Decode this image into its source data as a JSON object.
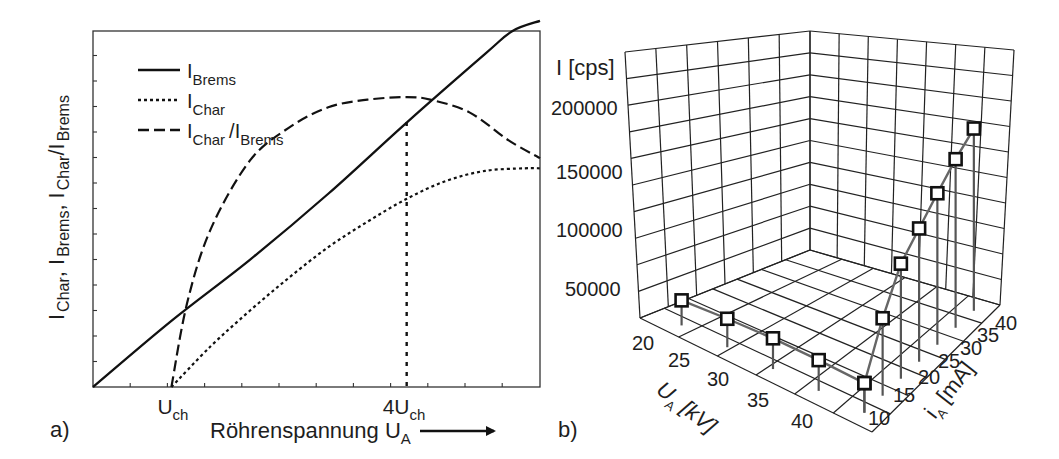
{
  "chart_data": [
    {
      "panel_label": "a)",
      "type": "line",
      "title": "",
      "xlabel": "Röhrenspannung U_A",
      "xlabel_main": "Röhrenspannung U",
      "xlabel_sub": "A",
      "ylabel_parts": [
        {
          "t": "I",
          "s": "Char"
        },
        {
          "t": ", I",
          "s": "Brems"
        },
        {
          "t": ", I",
          "s": "Char"
        },
        {
          "t": "/I",
          "s": "Brems"
        }
      ],
      "x_ticks": [
        {
          "main": "U",
          "sub": "ch",
          "x": 1
        },
        {
          "main": "4U",
          "sub": "ch",
          "x": 4
        }
      ],
      "xlim": [
        0,
        5.7
      ],
      "ylim": [
        0,
        14
      ],
      "grid": false,
      "legend_position": "upper left",
      "vline": {
        "x": 4,
        "style": "dotted"
      },
      "legend": [
        {
          "name": "I_Brems",
          "main": "I",
          "sub": "Brems",
          "style": "solid"
        },
        {
          "name": "I_Char",
          "main": "I",
          "sub": "Char",
          "style": "dotted"
        },
        {
          "name": "I_Char/I_Brems",
          "main": "I",
          "sub": "Char",
          "main2": "/I",
          "sub2": "Brems",
          "style": "dashed"
        }
      ],
      "series": [
        {
          "name": "I_Brems",
          "style": "solid",
          "x": [
            0,
            1,
            2,
            3,
            4,
            5,
            5.35,
            5.7
          ],
          "y": [
            0,
            2.6,
            5.0,
            7.6,
            10.4,
            13.1,
            14.0,
            14.4
          ]
        },
        {
          "name": "I_Char",
          "style": "dotted",
          "x": [
            1,
            1.5,
            2,
            2.5,
            3,
            3.5,
            4,
            4.5,
            5,
            5.5,
            5.7
          ],
          "y": [
            0,
            1.6,
            3.0,
            4.3,
            5.5,
            6.5,
            7.4,
            8.1,
            8.5,
            8.6,
            8.6
          ]
        },
        {
          "name": "I_Char/I_Brems",
          "style": "dashed",
          "x": [
            1,
            1.2,
            1.5,
            2,
            2.5,
            3,
            3.5,
            4,
            4.3,
            4.8,
            5.3,
            5.7
          ],
          "y": [
            0,
            3.3,
            6.2,
            8.9,
            10.2,
            11.0,
            11.3,
            11.4,
            11.3,
            10.8,
            9.7,
            9.0
          ]
        }
      ]
    },
    {
      "panel_label": "b)",
      "type": "scatter3d",
      "title": "",
      "zlabel": "I [cps]",
      "xlabel": "U_A [kV]",
      "xlabel_main": "U",
      "xlabel_sub": "A",
      "xlabel_unit": " [kV]",
      "ylabel": "i_A [mA]",
      "ylabel_main": "i",
      "ylabel_sub": "A",
      "ylabel_unit": " [mA]",
      "z_ticks": [
        "50000",
        "100000",
        "150000",
        "200000"
      ],
      "x_ticks": [
        "20",
        "25",
        "30",
        "35",
        "40"
      ],
      "y_ticks": [
        "10",
        "15",
        "20",
        "25",
        "30",
        "35",
        "40"
      ],
      "grid": true,
      "series": [
        {
          "name": "U_A scan (i_A = 10 mA)",
          "points": [
            {
              "U_A": 20,
              "i_A": 10,
              "I": 22000
            },
            {
              "U_A": 25,
              "i_A": 10,
              "I": 25000
            },
            {
              "U_A": 30,
              "i_A": 10,
              "I": 27000
            },
            {
              "U_A": 35,
              "i_A": 10,
              "I": 27000
            },
            {
              "U_A": 40,
              "i_A": 10,
              "I": 26000
            }
          ]
        },
        {
          "name": "i_A scan (U_A = 40 kV)",
          "points": [
            {
              "U_A": 40,
              "i_A": 10,
              "I": 26000
            },
            {
              "U_A": 40,
              "i_A": 15,
              "I": 68000
            },
            {
              "U_A": 40,
              "i_A": 20,
              "I": 101000
            },
            {
              "U_A": 40,
              "i_A": 25,
              "I": 117000
            },
            {
              "U_A": 40,
              "i_A": 30,
              "I": 133000
            },
            {
              "U_A": 40,
              "i_A": 35,
              "I": 148000
            },
            {
              "U_A": 40,
              "i_A": 40,
              "I": 160000
            }
          ]
        }
      ]
    }
  ]
}
